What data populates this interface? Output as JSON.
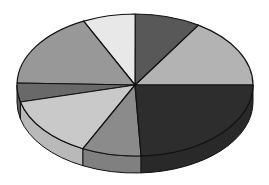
{
  "chart_data": {
    "type": "pie",
    "style": "3d-exploded-none",
    "title": "",
    "legend": "none",
    "labels_shown": false,
    "slices": [
      {
        "name": "Slice 1",
        "value": 16.0,
        "color": "#b3b3b3"
      },
      {
        "name": "Slice 2",
        "value": 9.0,
        "color": "#585858"
      },
      {
        "name": "Slice 3",
        "value": 7.2,
        "color": "#e8e8e8"
      },
      {
        "name": "Slice 4",
        "value": 17.4,
        "color": "#989898"
      },
      {
        "name": "Slice 5",
        "value": 4.3,
        "color": "#696969"
      },
      {
        "name": "Slice 6",
        "value": 13.9,
        "color": "#c9c9c9"
      },
      {
        "name": "Slice 7",
        "value": 8.1,
        "color": "#8b8b8b"
      },
      {
        "name": "Slice 8",
        "value": 24.2,
        "color": "#2d2d2d"
      }
    ],
    "start_angle_deg": 0,
    "direction": "counterclockwise"
  },
  "geometry": {
    "cx": 135,
    "cy": 85,
    "rx": 118,
    "ry": 71,
    "depth": 17,
    "stroke": "#111111"
  }
}
